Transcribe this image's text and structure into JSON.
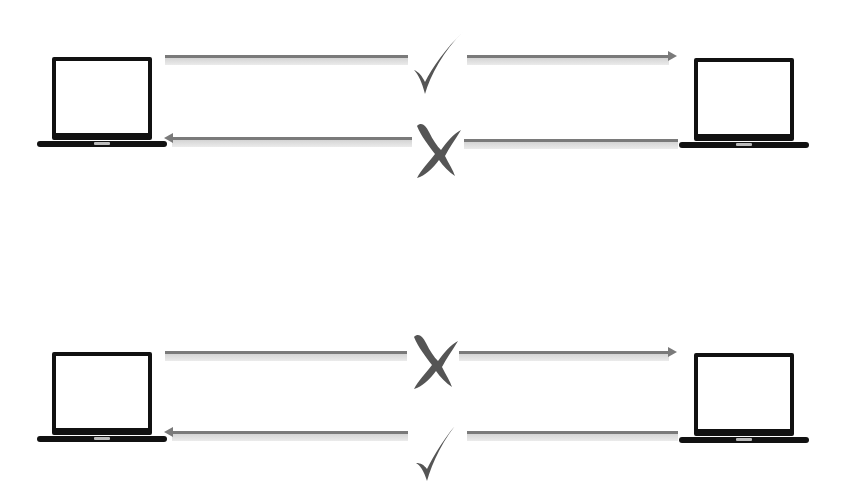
{
  "diagram": {
    "type": "connectivity-diagram",
    "description_visible": "",
    "colors": {
      "background": "#ffffff",
      "laptop": "#111111",
      "arrow": "#7a7a7a",
      "arrow_shadow": "#d0d0d0",
      "mark": "#555555"
    },
    "scenarios": [
      {
        "id": "top",
        "left_device": {
          "icon": "laptop-icon"
        },
        "right_device": {
          "icon": "laptop-icon"
        },
        "connections": [
          {
            "direction": "left-to-right",
            "status": "allowed",
            "mark_icon": "check-icon",
            "mark_glyph": "✓"
          },
          {
            "direction": "right-to-left",
            "status": "blocked",
            "mark_icon": "cross-icon",
            "mark_glyph": "✗"
          }
        ]
      },
      {
        "id": "bottom",
        "left_device": {
          "icon": "laptop-icon"
        },
        "right_device": {
          "icon": "laptop-icon"
        },
        "connections": [
          {
            "direction": "left-to-right",
            "status": "blocked",
            "mark_icon": "cross-icon",
            "mark_glyph": "✗"
          },
          {
            "direction": "right-to-left",
            "status": "allowed",
            "mark_icon": "check-icon",
            "mark_glyph": "✓"
          }
        ]
      }
    ]
  }
}
